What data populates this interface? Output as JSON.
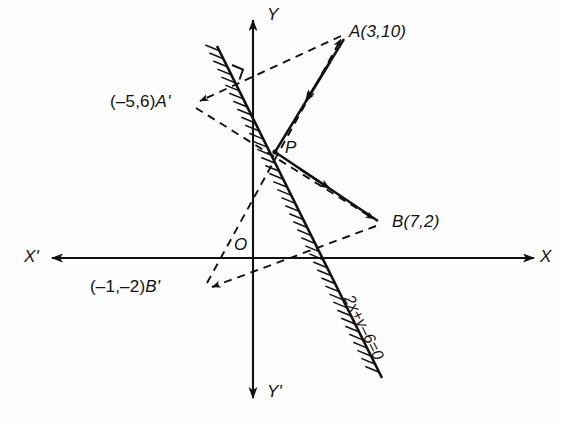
{
  "figure": {
    "background_color": "#fdfdfd",
    "ink_color": "#111111"
  },
  "axes": {
    "x_positive_label": "X",
    "x_negative_label": "X'",
    "y_positive_label": "Y",
    "y_negative_label": "Y'",
    "origin_label": "O"
  },
  "points": [
    {
      "name": "A",
      "label": "A(3,10)",
      "letter": "A",
      "coords": "(3,10)",
      "px": 345,
      "py": 33
    },
    {
      "name": "B",
      "label": "B(7,2)",
      "letter": "B",
      "coords": "(7,2)",
      "px": 380,
      "py": 222
    },
    {
      "name": "A-prime",
      "label": "(-5,6)A'",
      "letter": "A'",
      "coords": "(–5,6)",
      "px": 193,
      "py": 103
    },
    {
      "name": "B-prime",
      "label": "(-1,-2)B'",
      "letter": "B'",
      "coords": "(–1,–2)",
      "px": 205,
      "py": 288
    },
    {
      "name": "P",
      "label": "P",
      "letter": "P",
      "coords": "",
      "px": 275,
      "py": 152
    }
  ],
  "labels": {
    "point_a": "A(3,10)",
    "point_b": "B(7,2)",
    "point_a_prime_coords": "(–5,6)",
    "point_a_prime_name": "A'",
    "point_b_prime_coords": "(–1,–2)",
    "point_b_prime_name": "B'",
    "point_p": "P",
    "mirror_line_equation": "2x+y–6=0",
    "origin": "O",
    "x_axis": "X",
    "x_axis_negative": "X'",
    "y_axis": "Y",
    "y_axis_negative": "Y'"
  },
  "mirror_line": {
    "equation": "2x+y–6=0",
    "style": "solid-with-hatching",
    "hatch_side": "lower-left"
  },
  "rays": [
    {
      "name": "ray-A-to-P",
      "from": "A",
      "to": "P",
      "style": "solid",
      "arrow": "midpoint"
    },
    {
      "name": "ray-P-to-B",
      "from": "P",
      "to": "B",
      "style": "solid",
      "arrow": "midpoint"
    }
  ],
  "construction_lines": [
    {
      "name": "dashed-A-to-Aprime",
      "from": "A",
      "to": "A'",
      "style": "dashed",
      "arrow": "at-A-prime"
    },
    {
      "name": "dashed-Aprime-to-B",
      "from": "A'",
      "to": "B",
      "style": "dashed",
      "arrow": "at-B"
    },
    {
      "name": "dashed-Bprime-to-A",
      "from": "B'",
      "to": "A",
      "style": "dashed",
      "arrow": "at-A"
    },
    {
      "name": "dashed-B-to-Bprime",
      "from": "B",
      "to": "B'",
      "style": "dashed",
      "arrow": "at-B-prime"
    }
  ],
  "right_angle_marker": {
    "name": "right-angle-mark",
    "px": 240,
    "py": 70
  }
}
